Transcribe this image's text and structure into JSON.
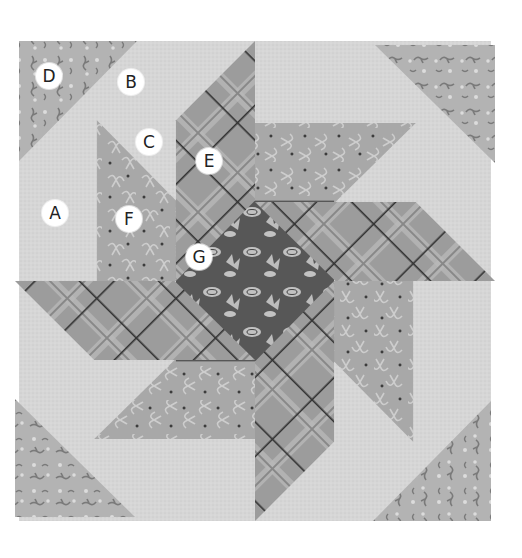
{
  "figure": {
    "labels": [
      {
        "id": "A",
        "text": "A"
      },
      {
        "id": "B",
        "text": "B"
      },
      {
        "id": "C",
        "text": "C"
      },
      {
        "id": "D",
        "text": "D"
      },
      {
        "id": "E",
        "text": "E"
      },
      {
        "id": "F",
        "text": "F"
      },
      {
        "id": "G",
        "text": "G"
      }
    ],
    "fabrics": {
      "background": {
        "name": "light background",
        "color": "#d4d4d4"
      },
      "corner_print": {
        "name": "sprig print corner",
        "color": "#b4b4b4",
        "motif_color": "#7a7a7a"
      },
      "ribbon_print": {
        "name": "ribbon print",
        "color": "#a9a9a9",
        "motif_color": "#cfcfcf"
      },
      "plaid": {
        "name": "plaid",
        "color": "#9d9d9d",
        "stripe_color": "#bdbdbd",
        "line_color": "#3a3a3a"
      },
      "center_print": {
        "name": "dark floral center",
        "color": "#5a5a5a",
        "motif_color": "#c4c4c4"
      }
    }
  }
}
